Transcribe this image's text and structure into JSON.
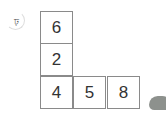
{
  "problem": {
    "label": "ঢ়",
    "number_label": "5"
  },
  "grid": {
    "cells": [
      {
        "row": 0,
        "col": 0,
        "value": "6"
      },
      {
        "row": 1,
        "col": 0,
        "value": "2"
      },
      {
        "row": 2,
        "col": 0,
        "value": "4"
      },
      {
        "row": 2,
        "col": 1,
        "value": "5"
      },
      {
        "row": 2,
        "col": 2,
        "value": "8"
      }
    ]
  }
}
